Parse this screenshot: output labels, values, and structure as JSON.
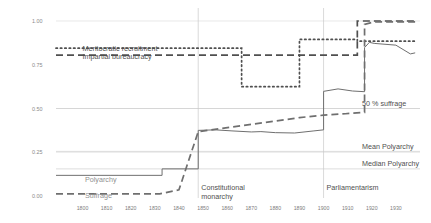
{
  "chart_data": {
    "type": "line",
    "title": "",
    "subtitle": "",
    "xlabel": "",
    "ylabel": "",
    "xlim": [
      1789,
      1940
    ],
    "ylim": [
      0.0,
      1.04
    ],
    "grid": true,
    "legend_position": "inline-annotations",
    "x_ticks": [
      "1800",
      "1810",
      "1820",
      "1830",
      "1840",
      "1850",
      "1860",
      "1870",
      "1880",
      "1890",
      "1900",
      "1910",
      "1920",
      "1930"
    ],
    "x_tick_values": [
      1800,
      1810,
      1820,
      1830,
      1840,
      1850,
      1860,
      1870,
      1880,
      1890,
      1900,
      1910,
      1920,
      1930
    ],
    "y_ticks": [
      "0.00",
      "0.25",
      "0.50",
      "0.75",
      "1.00"
    ],
    "y_tick_values": [
      0.0,
      0.25,
      0.5,
      0.75,
      1.0
    ],
    "reference_lines": [
      {
        "name": "50 % suffrage",
        "label": "50 % suffrage",
        "value": 0.5,
        "orientation": "horizontal"
      },
      {
        "name": "Mean Polyarchy",
        "label": "Mean Polyarchy",
        "value": 0.255,
        "orientation": "horizontal"
      },
      {
        "name": "Median Polyarchy",
        "label": "Median Polyarchy",
        "value": 0.155,
        "orientation": "horizontal"
      }
    ],
    "event_lines": [
      {
        "name": "Constitutional monarchy",
        "label_line1": "Constitutional",
        "label_line2": "monarchy",
        "x": 1848,
        "orientation": "vertical"
      },
      {
        "name": "Parliamentarism",
        "label_line1": "Parliamentarism",
        "label_line2": "",
        "x": 1900,
        "orientation": "vertical"
      }
    ],
    "series": [
      {
        "name": "Meritocratic recruitment",
        "label": "Meritocratic recruitment",
        "style": "dotted",
        "color": "#4f4f4f",
        "x": [
          1789,
          1866,
          1866,
          1890,
          1890,
          1914,
          1914,
          1938
        ],
        "values": [
          0.845,
          0.845,
          0.625,
          0.625,
          0.895,
          0.895,
          0.885,
          0.885
        ]
      },
      {
        "name": "Impartial bureaucracy",
        "label": "Impartial bureaucracy",
        "style": "dashed",
        "color": "#4f4f4f",
        "x": [
          1789,
          1914,
          1914,
          1938
        ],
        "values": [
          0.805,
          0.805,
          1.0,
          1.0
        ]
      },
      {
        "name": "Polyarchy",
        "label": "Polyarchy",
        "style": "solid",
        "color": "#6f6f6f",
        "x": [
          1789,
          1833,
          1833,
          1848,
          1848,
          1855,
          1862,
          1870,
          1874,
          1880,
          1888,
          1896,
          1900,
          1900,
          1906,
          1912,
          1917,
          1917,
          1919,
          1921,
          1930,
          1936,
          1938
        ],
        "values": [
          0.118,
          0.118,
          0.155,
          0.155,
          0.375,
          0.378,
          0.372,
          0.366,
          0.368,
          0.362,
          0.36,
          0.372,
          0.378,
          0.598,
          0.612,
          0.6,
          0.596,
          0.848,
          0.878,
          0.872,
          0.862,
          0.812,
          0.818
        ]
      },
      {
        "name": "Suffrage",
        "label": "Suffrage",
        "style": "dashed",
        "color": "#6f6f6f",
        "x": [
          1789,
          1832,
          1840,
          1848,
          1866,
          1880,
          1890,
          1900,
          1900,
          1909,
          1917,
          1917,
          1921,
          1938
        ],
        "values": [
          0.012,
          0.012,
          0.035,
          0.368,
          0.402,
          0.428,
          0.448,
          0.462,
          0.462,
          0.47,
          0.478,
          0.98,
          0.995,
          0.995
        ]
      }
    ],
    "annotations": [
      {
        "name": "meritocratic-recruitment-label",
        "text": "Meritocratic recruitment",
        "x": 1800,
        "y": 0.845
      },
      {
        "name": "impartial-bureaucracy-label",
        "text": "Impartial bureaucracy",
        "x": 1800,
        "y": 0.795
      },
      {
        "name": "polyarchy-label",
        "text": "Polyarchy",
        "x": 1801,
        "y": 0.095
      },
      {
        "name": "suffrage-label",
        "text": "Suffrage",
        "x": 1801,
        "y": 0.005
      }
    ]
  }
}
